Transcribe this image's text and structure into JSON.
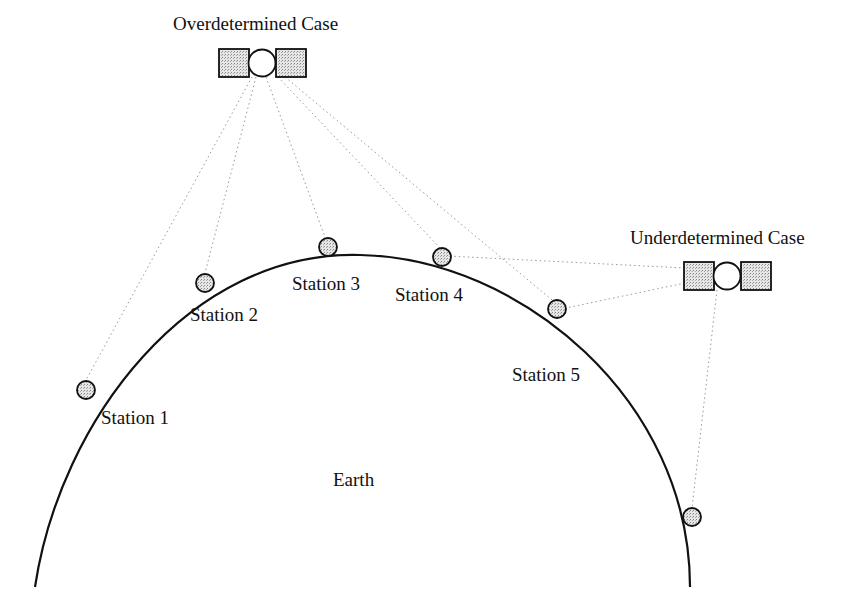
{
  "diagram": {
    "title_over": "Overdetermined Case",
    "title_under": "Underdetermined Case",
    "earth_label": "Earth",
    "stations": [
      {
        "label": "Station 1",
        "cx": 86,
        "cy": 390
      },
      {
        "label": "Station 2",
        "cx": 205,
        "cy": 283
      },
      {
        "label": "Station 3",
        "cx": 328,
        "cy": 247
      },
      {
        "label": "Station 4",
        "cx": 442,
        "cy": 257
      },
      {
        "label": "Station 5",
        "cx": 557,
        "cy": 309
      }
    ],
    "extra_station": {
      "label": "",
      "cx": 691,
      "cy": 517
    },
    "colors": {
      "line": "#111111",
      "fill": "#d9d9d9",
      "ray": "#999999"
    }
  }
}
